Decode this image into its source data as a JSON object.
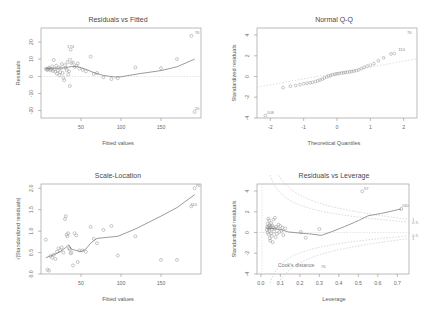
{
  "figure": {
    "background": "#ffffff",
    "point_color": "#9b9b9b",
    "line_color": "#7a7a7a",
    "layout": "2x2 regression diagnostic panels"
  },
  "chart_data": [
    {
      "type": "scatter",
      "panel": "top-left",
      "title": "Residuals vs Fitted",
      "xlabel": "Fitted values",
      "ylabel": "Residuals",
      "xlim": [
        0,
        200
      ],
      "ylim": [
        -28,
        24
      ],
      "xticks": [
        50,
        100,
        150
      ],
      "yticks": [
        -20,
        -10,
        0,
        10,
        20
      ],
      "grid": false,
      "reference_line": {
        "type": "horizontal",
        "y": 0,
        "style": "dotted"
      },
      "x": [
        6,
        7,
        8,
        9,
        10,
        11,
        12,
        13,
        14,
        15,
        16,
        17,
        18,
        19,
        20,
        21,
        22,
        23,
        24,
        25,
        26,
        27,
        28,
        29,
        30,
        31,
        32,
        33,
        34,
        35,
        36,
        37,
        38,
        40,
        42,
        44,
        46,
        48,
        52,
        56,
        62,
        66,
        70,
        78,
        88,
        96,
        118,
        150,
        170,
        188,
        192
      ],
      "y": [
        0.5,
        0.2,
        -0.3,
        0.4,
        1.1,
        0.6,
        -0.5,
        0.2,
        1.8,
        -0.8,
        5.5,
        0.3,
        -1.2,
        2.2,
        -2.4,
        -0.6,
        1.2,
        -3.2,
        -1.5,
        0.8,
        3.2,
        -2.0,
        -4.8,
        -6.2,
        2.5,
        1.0,
        -0.4,
        4.2,
        -2.8,
        -1.0,
        -9.5,
        11.5,
        3.8,
        4.0,
        1.5,
        2.2,
        3.5,
        0.6,
        -0.2,
        -1.0,
        7.5,
        -2.5,
        -2.0,
        -4.5,
        -5.5,
        -5.0,
        1.2,
        0.8,
        6.0,
        19.5,
        -24.5
      ],
      "loess": [
        [
          6,
          0.6
        ],
        [
          20,
          0.8
        ],
        [
          30,
          0.9
        ],
        [
          38,
          1.8
        ],
        [
          46,
          1.6
        ],
        [
          56,
          0.2
        ],
        [
          66,
          -1.8
        ],
        [
          78,
          -3.4
        ],
        [
          92,
          -4.3
        ],
        [
          100,
          -4.2
        ],
        [
          120,
          -2.6
        ],
        [
          150,
          -0.6
        ],
        [
          170,
          1.6
        ],
        [
          192,
          6.0
        ]
      ],
      "point_labels": [
        {
          "label": "174",
          "x": 32,
          "y": 11.5
        },
        {
          "label": "76",
          "x": 190,
          "y": 19.5
        },
        {
          "label": "20",
          "x": 190,
          "y": -24.5
        },
        {
          "label": "17",
          "x": 31,
          "y": 4.2
        }
      ]
    },
    {
      "type": "scatter",
      "panel": "top-right",
      "title": "Normal Q-Q",
      "xlabel": "Theoretical Quantiles",
      "ylabel": "Standardized residuals",
      "xlim": [
        -2.4,
        2.4
      ],
      "ylim": [
        -4.6,
        4.6
      ],
      "xticks": [
        -2,
        -1,
        0,
        1,
        2
      ],
      "yticks": [
        -4,
        -2,
        0,
        2,
        4
      ],
      "grid": false,
      "reference_line": {
        "type": "qq-line",
        "style": "dotted"
      },
      "x": [
        -2.15,
        -1.62,
        -1.4,
        -1.24,
        -1.11,
        -1.0,
        -0.9,
        -0.81,
        -0.73,
        -0.65,
        -0.58,
        -0.51,
        -0.44,
        -0.38,
        -0.31,
        -0.25,
        -0.19,
        -0.13,
        -0.06,
        0.0,
        0.06,
        0.13,
        0.19,
        0.25,
        0.31,
        0.38,
        0.44,
        0.51,
        0.58,
        0.65,
        0.73,
        0.81,
        0.9,
        1.0,
        1.11,
        1.24,
        1.4,
        1.62,
        1.72
      ],
      "y": [
        -4.35,
        -1.5,
        -1.35,
        -1.28,
        -1.18,
        -1.1,
        -1.05,
        -1.0,
        -0.95,
        -0.88,
        -0.8,
        -0.72,
        -0.62,
        -0.5,
        -0.4,
        -0.32,
        -0.25,
        -0.18,
        -0.12,
        -0.08,
        -0.05,
        0.0,
        0.02,
        0.05,
        0.08,
        0.12,
        0.15,
        0.2,
        0.25,
        0.32,
        0.45,
        0.58,
        0.7,
        0.8,
        0.95,
        1.25,
        1.55,
        1.95,
        2.0
      ],
      "point_labels": [
        {
          "label": "76",
          "x": 2.05,
          "y": 3.85
        },
        {
          "label": "110",
          "x": 1.82,
          "y": 2.05
        },
        {
          "label": "108",
          "x": -2.12,
          "y": -4.35
        }
      ]
    },
    {
      "type": "scatter",
      "panel": "bottom-left",
      "title": "Scale-Location",
      "xlabel": "Fitted values",
      "ylabel": "√|Standardized residuals|",
      "xlim": [
        0,
        200
      ],
      "ylim": [
        0.0,
        2.1
      ],
      "xticks": [
        50,
        100,
        150
      ],
      "yticks": [
        0.0,
        0.5,
        1.0,
        1.5,
        2.0
      ],
      "grid": false,
      "x": [
        6,
        8,
        10,
        12,
        14,
        16,
        18,
        20,
        22,
        24,
        26,
        28,
        30,
        31,
        32,
        33,
        34,
        35,
        36,
        37,
        38,
        40,
        42,
        44,
        46,
        48,
        52,
        56,
        62,
        66,
        70,
        78,
        88,
        96,
        118,
        150,
        170,
        188,
        192
      ],
      "y": [
        0.8,
        0.1,
        0.08,
        0.42,
        0.38,
        0.45,
        0.35,
        0.52,
        0.6,
        0.55,
        0.62,
        0.5,
        1.28,
        1.35,
        0.92,
        0.88,
        0.95,
        0.6,
        0.58,
        0.48,
        0.5,
        0.2,
        0.95,
        0.9,
        0.28,
        0.55,
        0.55,
        0.52,
        1.1,
        0.82,
        0.72,
        1.03,
        1.12,
        0.43,
        0.88,
        0.33,
        0.33,
        1.58,
        2.0
      ],
      "loess": [
        [
          6,
          0.38
        ],
        [
          16,
          0.45
        ],
        [
          24,
          0.52
        ],
        [
          31,
          0.62
        ],
        [
          35,
          0.68
        ],
        [
          38,
          0.58
        ],
        [
          44,
          0.55
        ],
        [
          50,
          0.52
        ],
        [
          56,
          0.58
        ],
        [
          62,
          0.72
        ],
        [
          70,
          0.83
        ],
        [
          80,
          0.85
        ],
        [
          96,
          0.88
        ],
        [
          118,
          1.05
        ],
        [
          150,
          1.35
        ],
        [
          170,
          1.55
        ],
        [
          192,
          1.85
        ]
      ],
      "point_labels": [
        {
          "label": "76",
          "x": 191,
          "y": 2.0
        },
        {
          "label": "110",
          "x": 186,
          "y": 1.55
        }
      ]
    },
    {
      "type": "scatter",
      "panel": "bottom-right",
      "title": "Residuals vs Leverage",
      "xlabel": "Leverage",
      "ylabel": "Standardized residuals",
      "xlim": [
        -0.02,
        0.76
      ],
      "ylim": [
        -4.6,
        4.6
      ],
      "xticks": [
        0.0,
        0.1,
        0.2,
        0.3,
        0.4,
        0.5,
        0.6,
        0.7
      ],
      "yticks": [
        -4,
        -2,
        0,
        2,
        4
      ],
      "grid": false,
      "cook_label": "Cook's distance",
      "cook_levels": [
        "1",
        "0.5",
        "0.5",
        "1"
      ],
      "reference_line": {
        "type": "horizontal",
        "y": 0,
        "style": "dotted"
      },
      "x": [
        0.03,
        0.032,
        0.034,
        0.035,
        0.036,
        0.038,
        0.04,
        0.04,
        0.042,
        0.043,
        0.044,
        0.045,
        0.046,
        0.047,
        0.048,
        0.05,
        0.052,
        0.053,
        0.055,
        0.056,
        0.058,
        0.06,
        0.062,
        0.065,
        0.068,
        0.07,
        0.072,
        0.075,
        0.078,
        0.082,
        0.086,
        0.09,
        0.095,
        0.1,
        0.105,
        0.11,
        0.115,
        0.125,
        0.205,
        0.23,
        0.3,
        0.52,
        0.72
      ],
      "y": [
        -0.1,
        0.2,
        0.52,
        -0.35,
        0.1,
        1.05,
        0.3,
        -0.55,
        0.85,
        -0.2,
        0.05,
        0.4,
        -0.95,
        0.15,
        -1.2,
        0.25,
        0.6,
        -0.45,
        0.0,
        -0.7,
        0.35,
        -1.35,
        0.18,
        0.95,
        -0.25,
        0.05,
        1.15,
        -0.85,
        0.22,
        -0.5,
        0.08,
        0.45,
        -0.32,
        0.3,
        -0.18,
        0.12,
        -0.62,
        0.05,
        -0.3,
        -0.9,
        0.0,
        3.85,
        2.05
      ],
      "loess": [
        [
          0.03,
          0.08
        ],
        [
          0.06,
          0.05
        ],
        [
          0.1,
          -0.05
        ],
        [
          0.14,
          -0.3
        ],
        [
          0.2,
          -0.42
        ],
        [
          0.26,
          -0.52
        ],
        [
          0.31,
          -0.65
        ],
        [
          0.36,
          -0.3
        ],
        [
          0.43,
          0.25
        ],
        [
          0.5,
          0.85
        ],
        [
          0.55,
          1.35
        ],
        [
          0.62,
          1.6
        ],
        [
          0.72,
          2.05
        ]
      ],
      "point_labels": [
        {
          "label": "57",
          "x": 0.52,
          "y": 3.85
        },
        {
          "label": "240",
          "x": 0.72,
          "y": 2.05
        },
        {
          "label": "76",
          "x": 0.3,
          "y": -4.15
        }
      ]
    }
  ]
}
